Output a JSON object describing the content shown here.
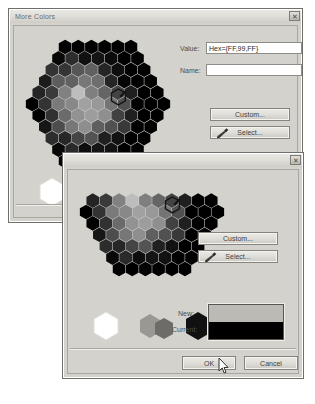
{
  "app": {
    "name": "More Colors color picker dialogs"
  },
  "dialogs": [
    {
      "id": "back",
      "title": "More Colors",
      "close_label": "✕",
      "fields": [
        {
          "label": "Value:",
          "value": "Hex={FF,99,FF}",
          "placeholder": ""
        },
        {
          "label": "Name:",
          "value": "",
          "placeholder": ""
        }
      ],
      "buttons": {
        "custom": "Custom...",
        "select": "Select...",
        "ok": "OK",
        "cancel": "Cancel"
      },
      "preview": {
        "new_label": "New:",
        "current_label": "Current:",
        "new_color": "#bcbab4",
        "current_color": "#000000"
      }
    },
    {
      "id": "front",
      "title": "",
      "close_label": "✕",
      "buttons": {
        "custom": "Custom...",
        "select": "Select...",
        "ok": "OK",
        "cancel": "Cancel"
      },
      "preview": {
        "new_label": "New:",
        "current_label": "Current:",
        "new_color": "#bcbab4",
        "current_color": "#000000"
      }
    }
  ],
  "palette": {
    "swatch_white": "#ffffff",
    "swatch_gray_a": "#9a9892",
    "swatch_gray_b": "#6e6c68",
    "swatch_black": "#111111",
    "selection_marker": "hexagon-outline-with-pointer"
  },
  "icons": {
    "eyedropper": "eyedropper-icon",
    "close": "close-icon",
    "cursor": "mouse-cursor-arrow"
  }
}
